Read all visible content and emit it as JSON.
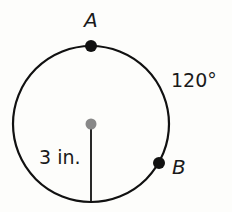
{
  "diagram": {
    "type": "circle-arc",
    "points": {
      "a": {
        "label": "A"
      },
      "b": {
        "label": "B"
      }
    },
    "arc_measure_label": "120°",
    "radius_label": "3 in.",
    "colors": {
      "stroke": "#111111",
      "center_dot": "#888888",
      "point_dot": "#111111"
    }
  }
}
